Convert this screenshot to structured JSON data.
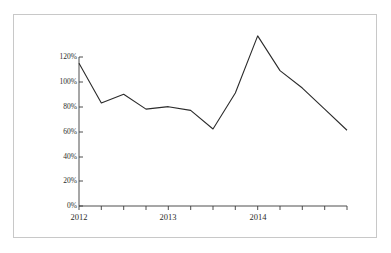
{
  "figure": {
    "frame_color": "#c8c8c8",
    "background": "#ffffff",
    "line_color": "#2b2b2b",
    "axis_color": "#3a3a3a"
  },
  "chart_data": {
    "type": "line",
    "title": "",
    "subtitle": "",
    "xlabel": "",
    "ylabel": "",
    "grid": false,
    "legend": "none",
    "x_tick_labels": [
      "2012",
      "2013",
      "2014"
    ],
    "x_major_tick_positions": [
      0,
      4,
      8
    ],
    "x_minor_tick_count": 12,
    "y_tick_labels": [
      "0%",
      "20%",
      "40%",
      "60%",
      "80%",
      "100%",
      "120%"
    ],
    "y_tick_values": [
      0,
      20,
      40,
      60,
      80,
      100,
      120
    ],
    "ylim": [
      0,
      125
    ],
    "xlim": [
      0,
      12
    ],
    "categories": [
      "2012 Q1",
      "2012 Q2",
      "2012 Q3",
      "2012 Q4",
      "2013 Q1",
      "2013 Q2",
      "2013 Q3",
      "2013 Q4",
      "2014 Q1",
      "2014 Q2",
      "2014 Q3",
      "2014 Q4",
      "2015 Q1"
    ],
    "series": [
      {
        "name": "",
        "values": [
          115,
          83,
          90,
          78,
          80,
          77,
          62,
          91,
          137,
          109,
          95,
          78,
          61
        ]
      }
    ]
  }
}
